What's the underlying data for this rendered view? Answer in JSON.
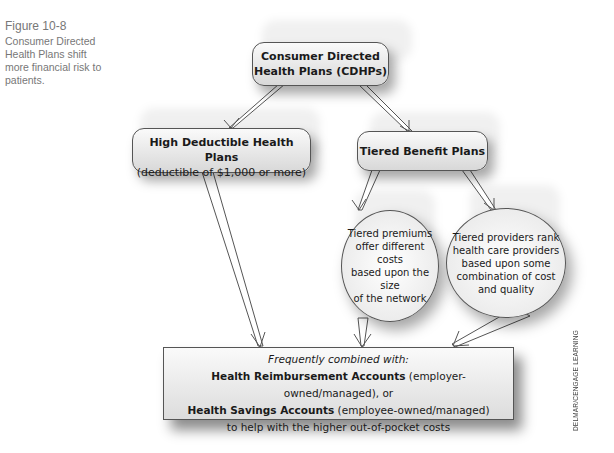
{
  "caption": {
    "figure_number": "Figure 10-8",
    "text": "Consumer Directed Health Plans shift more financial risk to patients."
  },
  "diagram": {
    "root": {
      "line1": "Consumer Directed",
      "line2": "Health Plans (CDHPs)"
    },
    "hdhp": {
      "title": "High Deductible Health Plans",
      "subtitle": "(deductible of $1,000 or more)"
    },
    "tiered": {
      "title": "Tiered Benefit Plans"
    },
    "tiered_premiums": {
      "lines": [
        "Tiered premiums",
        "offer different costs",
        "based upon the size",
        "of the network"
      ]
    },
    "tiered_providers": {
      "lines": [
        "Tiered providers rank",
        "health care providers",
        "based upon some",
        "combination of cost",
        "and quality"
      ]
    },
    "combined": {
      "intro": "Frequently combined with:",
      "hra_bold": "Health Reimbursement Accounts",
      "hra_rest": " (employer-owned/managed), or",
      "hsa_bold": "Health Savings Accounts",
      "hsa_rest": " (employee-owned/managed)",
      "closing": "to help with the higher out-of-pocket costs"
    },
    "credit": "DELMAR/CENGAGE LEARNING"
  }
}
